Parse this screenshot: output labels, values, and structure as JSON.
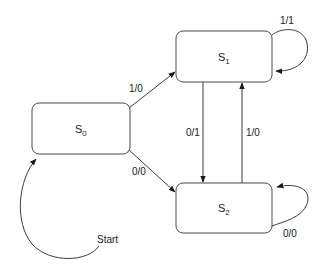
{
  "diagram": {
    "type": "finite-state-machine",
    "states": [
      {
        "id": "S0",
        "name": "S",
        "subscript": "0"
      },
      {
        "id": "S1",
        "name": "S",
        "subscript": "1"
      },
      {
        "id": "S2",
        "name": "S",
        "subscript": "2"
      }
    ],
    "transitions": [
      {
        "from": "S0",
        "to": "S1",
        "label": "1/0"
      },
      {
        "from": "S0",
        "to": "S2",
        "label": "0/0"
      },
      {
        "from": "S1",
        "to": "S2",
        "label": "0/1"
      },
      {
        "from": "S2",
        "to": "S1",
        "label": "1/0"
      },
      {
        "from": "S1",
        "to": "S1",
        "label": "1/1"
      },
      {
        "from": "S2",
        "to": "S2",
        "label": "0/0"
      }
    ],
    "start": {
      "label": "Start",
      "target": "S0"
    },
    "colors": {
      "stroke": "#3c3c3c",
      "background": "#ffffff",
      "text": "#222222"
    }
  }
}
